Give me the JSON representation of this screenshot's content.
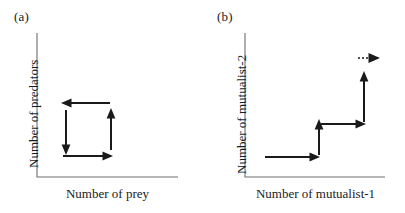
{
  "figure": {
    "type": "diagram",
    "background_color": "#ffffff",
    "line_color": "#1a1a1a",
    "axis_color": "#6e6e6e"
  },
  "panels": [
    {
      "id": "a",
      "label": "(a)",
      "axis_x_label": "Number of prey",
      "axis_y_label": "Number of predators",
      "pattern": "closed counter-clockwise cycle",
      "arrows": [
        {
          "name": "top-arrow-left",
          "direction": "left",
          "style": "solid"
        },
        {
          "name": "left-arrow-down",
          "direction": "down",
          "style": "solid"
        },
        {
          "name": "bottom-arrow-right",
          "direction": "right",
          "style": "solid"
        },
        {
          "name": "right-arrow-up",
          "direction": "up",
          "style": "solid"
        }
      ]
    },
    {
      "id": "b",
      "label": "(b)",
      "axis_x_label": "Number of mutualist-1",
      "axis_y_label": "Number of mutualist-2",
      "pattern": "open escalating staircase with dashed continuation",
      "arrows": [
        {
          "name": "step1-arrow-right",
          "direction": "right",
          "style": "solid"
        },
        {
          "name": "step2-arrow-up",
          "direction": "up",
          "style": "solid"
        },
        {
          "name": "step3-arrow-right",
          "direction": "right",
          "style": "solid"
        },
        {
          "name": "step4-arrow-up",
          "direction": "up",
          "style": "solid"
        },
        {
          "name": "continuation-arrow-right",
          "direction": "right",
          "style": "dashed"
        }
      ]
    }
  ]
}
